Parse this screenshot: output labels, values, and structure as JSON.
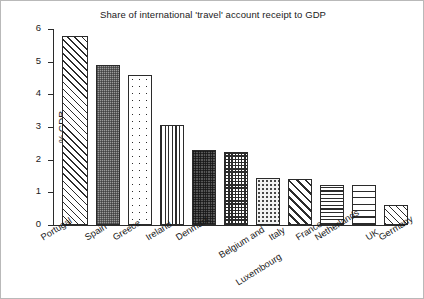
{
  "chart_data": {
    "type": "bar",
    "title": "Share of international 'travel' account receipt to GDP",
    "xlabel": "",
    "ylabel": "% GDR",
    "ylim": [
      0,
      6
    ],
    "yticks": [
      0,
      1,
      2,
      3,
      4,
      5,
      6
    ],
    "grid": false,
    "legend": "none",
    "categories": [
      "Portugal",
      "Spain",
      "Greece",
      "Ireland",
      "Denmark",
      "Belgium and Luxembourg",
      "Italy",
      "France",
      "Netherlands",
      "UK",
      "Germany"
    ],
    "values": [
      5.8,
      4.9,
      4.6,
      3.05,
      2.3,
      2.25,
      1.45,
      1.42,
      1.22,
      1.22,
      0.62
    ],
    "bar_fills": [
      "diagonal-hatch-fine",
      "checkerboard-grey",
      "dots-sparse",
      "vertical-stripes",
      "checkerboard-dark",
      "checkerboard-medium",
      "dots-fine",
      "diagonal-hatch-bold",
      "horizontal-lines-tight",
      "horizontal-lines-wide",
      "diagonal-hatch-fine"
    ]
  },
  "axis": {
    "tick_labels": [
      "0",
      "1",
      "2",
      "3",
      "4",
      "5",
      "6"
    ],
    "y_title": "% GDR"
  },
  "colors": {
    "ink": "#2b2b2b",
    "background": "#ffffff",
    "frame": "#b9b9b9"
  }
}
